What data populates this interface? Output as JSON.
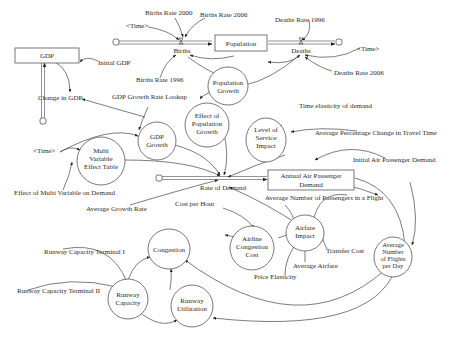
{
  "diagram": {
    "stocks": {
      "gdp": "GDP",
      "population": "Population",
      "annual_demand_line1": "Annual Air Passenger",
      "annual_demand_line2": "Demand"
    },
    "flows": {
      "births": "Births",
      "deaths": "Deaths",
      "change_in_gdp": "Change in GDP",
      "rate_of_demand": "Rate of Demand"
    },
    "auxiliaries": {
      "population_growth": [
        "Population",
        "Growth"
      ],
      "effect_of_population_growth": [
        "Effect of",
        "Population",
        "Growth"
      ],
      "gdp_growth": [
        "GDP",
        "Growth"
      ],
      "level_of_service_impact": [
        "Level of",
        "Service",
        "Impact"
      ],
      "multi_variable_effect_table": [
        "Multi",
        "Variable",
        "Effect Table"
      ],
      "congestion": [
        "Congestion"
      ],
      "airline_congestion_cost": [
        "Airline",
        "Congestion",
        "Cost"
      ],
      "airfare_impact": [
        "Airfare",
        "Impact"
      ],
      "average_flights_per_day": [
        "Average",
        "Number",
        "of Flights",
        "per Day"
      ],
      "runway_capacity": [
        "Runway",
        "Capacity"
      ],
      "runway_utilization": [
        "Runway",
        "Utilization"
      ]
    },
    "constants": {
      "births_rate_2000": "Births Rate 2000",
      "births_rate_2006": "Births Rate 2006",
      "births_rate_1996": "Births Rate 1996",
      "time_births": "<Time>",
      "deaths_rate_1996": "Deaths Rate 1996",
      "deaths_rate_2006": "Deaths Rate 2006",
      "time_deaths": "<Time>",
      "initial_gdp": "Initial GDP",
      "gdp_growth_rate_lookup": "GDP Growth Rate Lookup",
      "time_elasticity": "Time elasticity of demand",
      "avg_pct_change_travel_time": "Average Percentage Change in Travel Time",
      "time_multi": "<Time>",
      "effect_multi_variable": "Effect of Multi Variable on Demand",
      "average_growth_rate": "Average Growth Rate",
      "initial_air_passenger_demand": "Initial Air Passenger Demand",
      "avg_passengers_per_flight": "Average Number of Passengers in a Flight",
      "cost_per_hour": "Cost per Hour",
      "transfer_cost": "Transfer Cost",
      "average_airfare": "Average Airfare",
      "price_elasticity": "Price Elasticity",
      "runway_capacity_terminal_1": "Runway Capacity Terminal I",
      "runway_capacity_terminal_2": "Runway Capacity Terminal II"
    }
  }
}
